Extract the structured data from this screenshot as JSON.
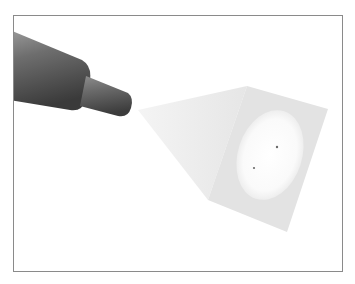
{
  "figure": {
    "elements": {
      "device": "emitter-cylinder",
      "beam": "light-cone",
      "screen": "projection-screen",
      "spot": "elliptical-light-spot",
      "marks": 2
    },
    "colors": {
      "frame": "#8a8a8a",
      "device_dark": "#3e3e3e",
      "device_light": "#8c8c8c",
      "beam": "#ececec",
      "screen": "#e4e4e4",
      "spot": "#fbfbfb",
      "mark": "#6a6a6a"
    }
  }
}
